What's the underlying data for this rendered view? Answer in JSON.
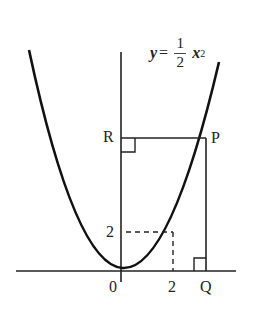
{
  "diagram": {
    "type": "parabola-coordinate-figure",
    "equation": {
      "lhs": "y",
      "equals": "=",
      "numerator": "1",
      "denominator": "2",
      "variable": "x",
      "exponent": "2"
    },
    "points": {
      "R": "R",
      "P": "P",
      "Q": "Q",
      "origin": "0"
    },
    "tick_labels": {
      "x_tick": "2",
      "y_tick": "2"
    },
    "colors": {
      "stroke": "#222222",
      "background": "#ffffff"
    }
  }
}
